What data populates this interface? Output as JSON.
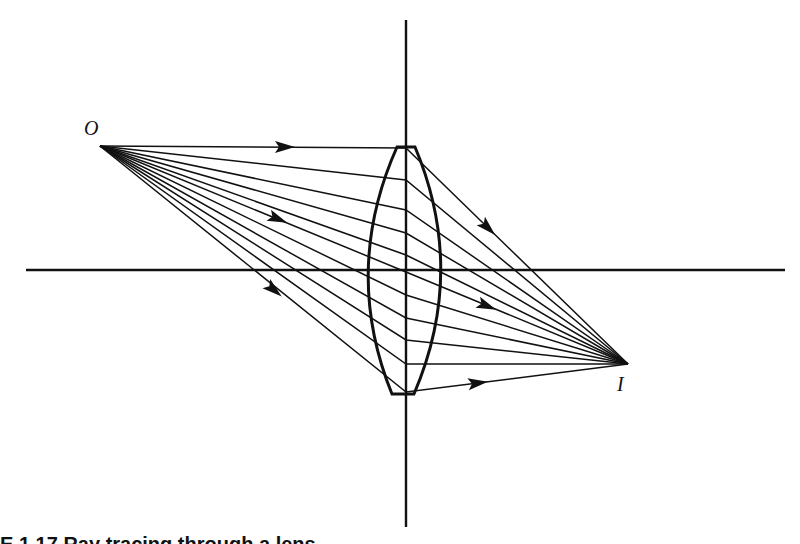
{
  "diagram": {
    "type": "thin lens ray diagram",
    "labels": {
      "object": "O",
      "image": "I"
    },
    "caption_partial": "E 1.17  Ray tracing through a lens",
    "colors": {
      "background": "#ffffff",
      "ink": "#111111"
    },
    "geometry": {
      "object_point": [
        100,
        146
      ],
      "image_point": [
        628,
        364
      ],
      "optical_axis_y": 270,
      "optical_axis_x_range": [
        26,
        785
      ],
      "lens_axis_x": 406,
      "lens_axis_y_range": [
        20,
        527
      ],
      "lens_top_y": 147,
      "lens_bottom_y": 394,
      "lens_left_x": 374,
      "lens_right_x": 437,
      "ray_crossing_y_at_lens": [
        148,
        180,
        210,
        233,
        255,
        272,
        295,
        318,
        340,
        364,
        392
      ]
    },
    "arrows": [
      {
        "x": 285,
        "y": 147,
        "direction": "right"
      },
      {
        "x": 278,
        "y": 219,
        "direction": "down-right"
      },
      {
        "x": 274,
        "y": 290,
        "direction": "down-right"
      },
      {
        "x": 488,
        "y": 228,
        "direction": "down-right"
      },
      {
        "x": 487,
        "y": 306,
        "direction": "down-right"
      },
      {
        "x": 478,
        "y": 383,
        "direction": "right"
      }
    ]
  }
}
